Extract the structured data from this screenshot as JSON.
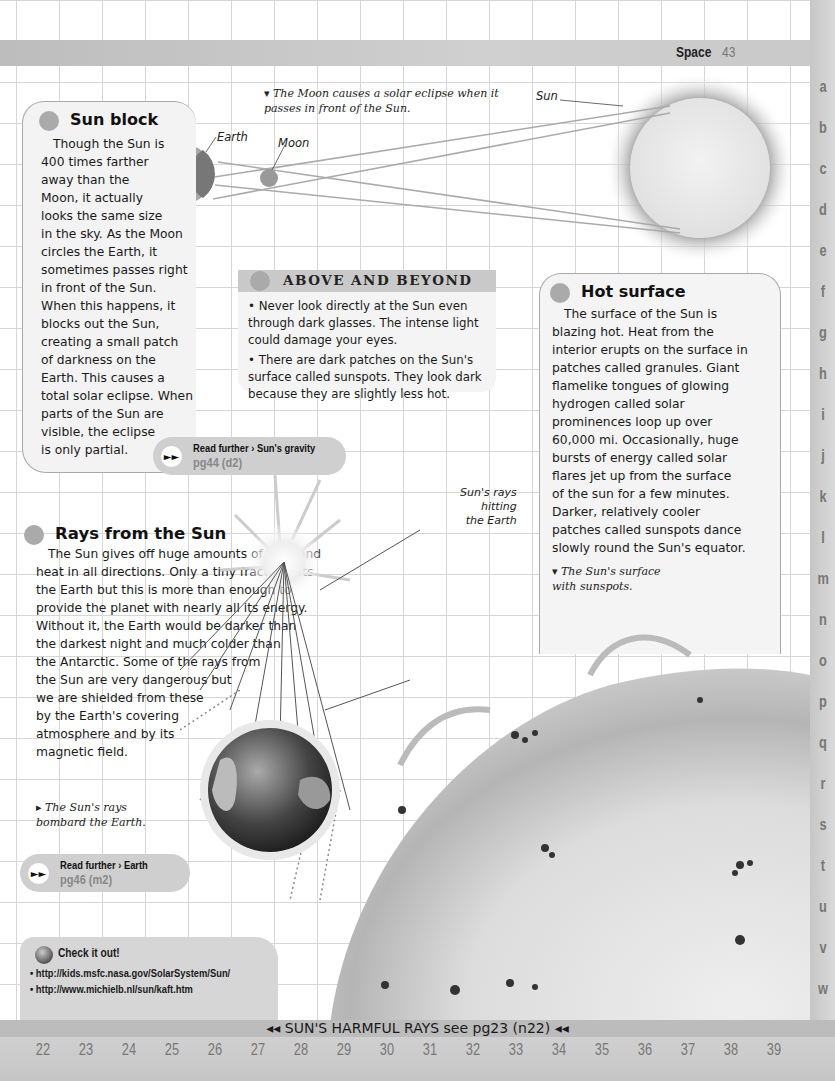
{
  "header": {
    "section": "Space",
    "page_number": "43"
  },
  "side_index": [
    "a",
    "b",
    "c",
    "d",
    "e",
    "f",
    "g",
    "h",
    "i",
    "j",
    "k",
    "l",
    "m",
    "n",
    "o",
    "p",
    "q",
    "r",
    "s",
    "t",
    "u",
    "v",
    "w"
  ],
  "eclipse_diagram": {
    "caption": "▾ The Moon causes a solar eclipse when it passes in front of the Sun.",
    "labels": {
      "earth": "Earth",
      "moon": "Moon",
      "sun": "Sun"
    }
  },
  "sun_block": {
    "title": "Sun block",
    "body": "Though the Sun is 400 times farther away than the Moon, it actually looks the same size in the sky. As the Moon circles the Earth, it sometimes passes right in front of the Sun. When this happens, it blocks out the Sun, creating a small patch of darkness on the Earth. This causes a total solar eclipse. When parts of the Sun are visible, the eclipse is only partial.",
    "lines": [
      "Though the Sun is",
      "400 times farther",
      "away than the",
      "Moon, it actually",
      "looks the same size",
      "in the sky. As the Moon",
      "circles the Earth, it",
      "sometimes passes right",
      "in front of the Sun.",
      "When this happens, it",
      "blocks out the Sun,",
      "creating a small patch",
      "of darkness on the",
      "Earth. This causes a",
      "total solar eclipse. When",
      "parts of the Sun are",
      "visible, the eclipse",
      "is only partial."
    ]
  },
  "read_further_1": {
    "label": "Read further › Sun's gravity",
    "ref": "pg44 (d2)"
  },
  "above_and_beyond": {
    "title": "ABOVE AND BEYOND",
    "items": [
      "• Never look directly at the Sun even through dark glasses. The intense light could damage your eyes.",
      "• There are dark patches on the Sun's surface called sunspots. They look dark because they are slightly less hot."
    ]
  },
  "hot_surface": {
    "title": "Hot surface",
    "lines": [
      "The surface of the Sun is",
      "blazing hot. Heat from the",
      "interior erupts on the surface in",
      "patches called granules. Giant",
      "flamelike tongues of glowing",
      "hydrogen called solar",
      "prominences loop up over",
      "60,000 mi. Occasionally, huge",
      "bursts of energy called solar",
      "flares jet up from the surface",
      "of the sun for a few minutes.",
      "Darker, relatively cooler",
      "patches called sunspots dance",
      "slowly round the Sun's equator."
    ],
    "caption_lines": [
      "▾ The Sun's surface",
      "with sunspots."
    ]
  },
  "rays": {
    "title": "Rays from the Sun",
    "lines": [
      "The Sun gives off huge amounts of light and",
      "heat in all directions. Only a tiny fraction hits",
      "the Earth but this is more than enough to",
      "provide the planet with nearly all its energy.",
      "Without it, the Earth would be darker than",
      "the darkest night and much colder than",
      "the Antarctic. Some of the rays from",
      "the Sun are very dangerous but",
      "we are shielded from these",
      "by the Earth's covering",
      "atmosphere and by its",
      "magnetic field."
    ],
    "label_lines": [
      "Sun's rays",
      "hitting",
      "the Earth"
    ],
    "caption_lines": [
      "▸ The Sun's rays",
      "bombard the Earth."
    ]
  },
  "read_further_2": {
    "label": "Read further › Earth",
    "ref": "pg46 (m2)"
  },
  "check_it_out": {
    "title": "Check it out!",
    "links": [
      "• http://kids.msfc.nasa.gov/SolarSystem/Sun/",
      "• http://www.michielb.nl/sun/kaft.htm"
    ]
  },
  "footer": {
    "cross_ref": "◂◂ SUN'S HARMFUL RAYS see pg23 (n22) ◂◂",
    "grid_numbers": [
      "22",
      "23",
      "24",
      "25",
      "26",
      "27",
      "28",
      "29",
      "30",
      "31",
      "32",
      "33",
      "34",
      "35",
      "36",
      "37",
      "38",
      "39"
    ]
  }
}
